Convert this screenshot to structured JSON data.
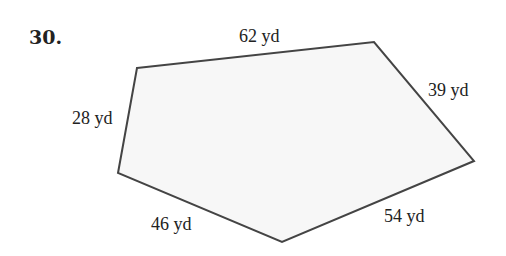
{
  "problem_number": "30.",
  "shape": "pentagon",
  "colors": {
    "fill": "#f7f7f7",
    "stroke": "#444444"
  },
  "vertices": [
    [
      137,
      68
    ],
    [
      374,
      42
    ],
    [
      474,
      161
    ],
    [
      282,
      242
    ],
    [
      118,
      173
    ]
  ],
  "sides": [
    {
      "label": "62 yd"
    },
    {
      "label": "39 yd"
    },
    {
      "label": "54 yd"
    },
    {
      "label": "46 yd"
    },
    {
      "label": "28 yd"
    }
  ]
}
